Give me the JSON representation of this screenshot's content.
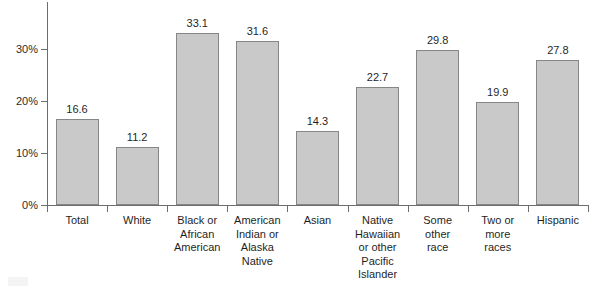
{
  "chart_data": {
    "type": "bar",
    "title": "",
    "subtitle": "",
    "xlabel": "",
    "ylabel": "",
    "ylim": [
      0,
      36
    ],
    "grid": false,
    "legend": "none",
    "orientation": "vertical",
    "y_tick_labels": [
      "0%",
      "10%",
      "20%",
      "30%"
    ],
    "y_tick_values": [
      0,
      10,
      20,
      30
    ],
    "categories": [
      "Total",
      "White",
      "Black or African American",
      "American Indian or Alaska Native",
      "Asian",
      "Native Hawaiian or other Pacific Islander",
      "Some other race",
      "Two or more races",
      "Hispanic"
    ],
    "category_label_lines": [
      [
        "Total"
      ],
      [
        "White"
      ],
      [
        "Black or",
        "African",
        "American"
      ],
      [
        "American",
        "Indian or",
        "Alaska",
        "Native"
      ],
      [
        "Asian"
      ],
      [
        "Native",
        "Hawaiian",
        "or other",
        "Pacific",
        "Islander"
      ],
      [
        "Some",
        "other",
        "race"
      ],
      [
        "Two or",
        "more",
        "races"
      ],
      [
        "Hispanic"
      ]
    ],
    "values": [
      16.6,
      11.2,
      33.1,
      31.6,
      14.3,
      22.7,
      29.8,
      19.9,
      27.8
    ],
    "value_labels": [
      "16.6",
      "11.2",
      "33.1",
      "31.6",
      "14.3",
      "22.7",
      "29.8",
      "19.9",
      "27.8"
    ],
    "colors": {
      "bar_fill": "#c9c9c9",
      "bar_border": "#868686",
      "axis": "#6d6d6d",
      "text": "#1f1f1f",
      "background": "#ffffff"
    }
  }
}
